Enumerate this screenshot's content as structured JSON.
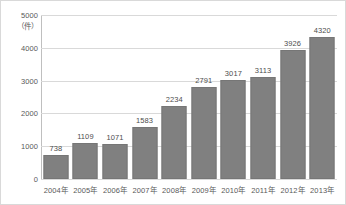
{
  "chart_data": {
    "type": "bar",
    "title": "",
    "subtitle": "",
    "xlabel": "",
    "ylabel": "（件）",
    "categories": [
      "2004年",
      "2005年",
      "2006年",
      "2007年",
      "2008年",
      "2009年",
      "2010年",
      "2011年",
      "2012年",
      "2013年"
    ],
    "values": [
      738,
      1109,
      1071,
      1583,
      2234,
      2791,
      3017,
      3113,
      3926,
      4320
    ],
    "value_labels": [
      "738",
      "1109",
      "1071",
      "1583",
      "2234",
      "2791",
      "3017",
      "3113",
      "3926",
      "4320"
    ],
    "ylim": [
      0,
      5000
    ],
    "yticks": [
      0,
      1000,
      2000,
      3000,
      4000,
      5000
    ],
    "ytick_labels": [
      "0",
      "1000",
      "2000",
      "3000",
      "4000",
      "5000"
    ],
    "grid": true,
    "legend": false,
    "legend_position": "none",
    "series": [
      {
        "name": "件数",
        "values": [
          738,
          1109,
          1071,
          1583,
          2234,
          2791,
          3017,
          3113,
          3926,
          4320
        ]
      }
    ],
    "colors": {
      "bar_fill": "#808080",
      "bar_border": "#767676",
      "gridline": "#d9d9d9",
      "axis": "#bfbfbf",
      "text": "#595959",
      "frame_border": "#d9d9d9",
      "background": "#ffffff"
    }
  }
}
